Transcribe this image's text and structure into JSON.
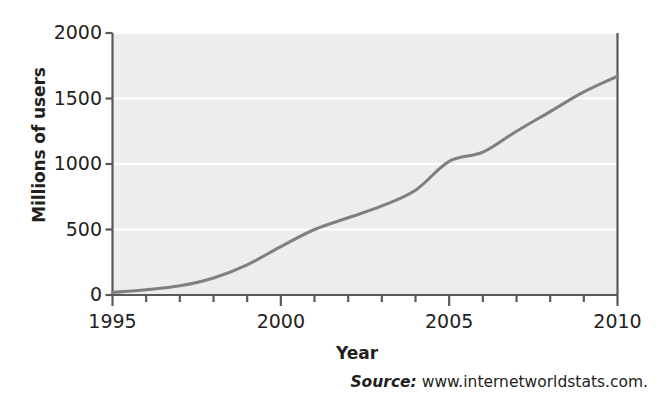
{
  "figure": {
    "ylabel": "Millions of users",
    "xlabel": "Year",
    "source_word": "Source:",
    "source_url": "www.internetworldstats.com.",
    "plot_background": "#ededed",
    "line_color": "#808080",
    "grid_color": "#ffffff",
    "axis_color": "#58595b",
    "text_color": "#231f20"
  },
  "chart_data": {
    "type": "line",
    "title": "",
    "xlabel": "Year",
    "ylabel": "Millions of users",
    "xlim": [
      1995,
      2010
    ],
    "ylim": [
      0,
      2000
    ],
    "xticks": [
      1995,
      2000,
      2005,
      2010
    ],
    "xtick_labels": [
      "1995",
      "2000",
      "2005",
      "2010"
    ],
    "x_minor_tick_step": 1,
    "yticks": [
      0,
      500,
      1000,
      1500,
      2000
    ],
    "ytick_labels": [
      "0",
      "500",
      "1000",
      "1500",
      "2000"
    ],
    "grid": "horizontal",
    "legend": "none",
    "x": [
      1995,
      1996,
      1997,
      1998,
      1999,
      2000,
      2001,
      2002,
      2003,
      2004,
      2005,
      2006,
      2007,
      2008,
      2009,
      2010
    ],
    "values": [
      20,
      40,
      70,
      130,
      230,
      370,
      500,
      590,
      680,
      800,
      1020,
      1090,
      1250,
      1400,
      1550,
      1670
    ],
    "series": [
      {
        "name": "Internet users worldwide",
        "values": [
          20,
          40,
          70,
          130,
          230,
          370,
          500,
          590,
          680,
          800,
          1020,
          1090,
          1250,
          1400,
          1550,
          1670
        ]
      }
    ]
  }
}
